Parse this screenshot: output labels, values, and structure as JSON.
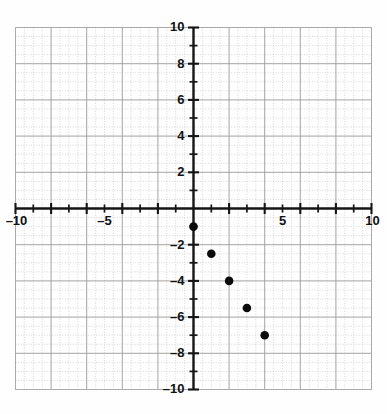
{
  "top_text": "p g p ,",
  "chart_data": {
    "type": "scatter",
    "title": "",
    "subtitle": "",
    "xlabel": "",
    "ylabel": "",
    "xlim": [
      -10,
      10
    ],
    "ylim": [
      -10,
      10
    ],
    "grid": true,
    "minor_grid_step": 0.5,
    "major_grid_step": 2,
    "tick_step_minor": 1,
    "tick_step_major": 2,
    "legend": null,
    "legend_position": "none",
    "x_tick_labels": [
      {
        "value": -10,
        "text": "–10"
      },
      {
        "value": -5,
        "text": "–5"
      },
      {
        "value": 5,
        "text": "5"
      },
      {
        "value": 10,
        "text": "10"
      }
    ],
    "y_tick_labels": [
      {
        "value": 10,
        "text": "10"
      },
      {
        "value": 8,
        "text": "8"
      },
      {
        "value": 6,
        "text": "6"
      },
      {
        "value": 4,
        "text": "4"
      },
      {
        "value": 2,
        "text": "2"
      },
      {
        "value": -2,
        "text": "–2"
      },
      {
        "value": -4,
        "text": "–4"
      },
      {
        "value": -6,
        "text": "–6"
      },
      {
        "value": -8,
        "text": "–8"
      },
      {
        "value": -10,
        "text": "–10"
      }
    ],
    "series": [
      {
        "name": "points",
        "marker": "circle",
        "color": "#0b0b0b",
        "points": [
          {
            "x": 0,
            "y": -1
          },
          {
            "x": 1,
            "y": -2.5
          },
          {
            "x": 2,
            "y": -4
          },
          {
            "x": 3,
            "y": -5.5
          },
          {
            "x": 4,
            "y": -7
          }
        ]
      }
    ]
  }
}
